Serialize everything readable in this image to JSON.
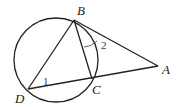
{
  "diagram": {
    "type": "geometry",
    "circle": {
      "cx": 56,
      "cy": 60,
      "r": 42
    },
    "points": {
      "A": {
        "label": "A",
        "x": 158,
        "y": 66
      },
      "B": {
        "label": "B",
        "x": 74,
        "y": 20
      },
      "C": {
        "label": "C",
        "x": 92,
        "y": 79
      },
      "D": {
        "label": "D",
        "x": 28,
        "y": 89
      }
    },
    "segments": [
      [
        "B",
        "A"
      ],
      [
        "D",
        "A"
      ],
      [
        "B",
        "D"
      ],
      [
        "B",
        "C"
      ]
    ],
    "angles": [
      {
        "label": "1",
        "vertex": "D"
      },
      {
        "label": "2",
        "vertex": "B"
      }
    ],
    "colors": {
      "line": "#222222",
      "background": "#ffffff"
    }
  }
}
